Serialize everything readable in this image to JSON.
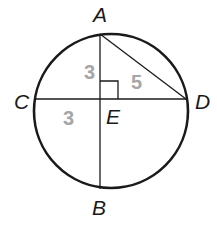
{
  "diagram": {
    "type": "circle-chords",
    "colors": {
      "stroke": "#1a1a1a",
      "length_label": "#a6a6a6",
      "background": "#ffffff"
    },
    "circle": {
      "cx": 111,
      "cy": 111,
      "r": 77
    },
    "points": {
      "A": {
        "label": "A",
        "x": 100,
        "y": 33
      },
      "B": {
        "label": "B",
        "x": 100,
        "y": 189
      },
      "C": {
        "label": "C",
        "x": 34,
        "y": 99
      },
      "D": {
        "label": "D",
        "x": 187,
        "y": 99
      },
      "E": {
        "label": "E",
        "x": 100,
        "y": 99
      }
    },
    "segments": [
      {
        "from": "A",
        "to": "B",
        "name": "chord-AB"
      },
      {
        "from": "C",
        "to": "D",
        "name": "chord-CD"
      },
      {
        "from": "A",
        "to": "D",
        "name": "segment-AD"
      }
    ],
    "length_labels": {
      "AE": "3",
      "CE": "3",
      "AD": "5"
    },
    "right_angle_at": "E"
  }
}
